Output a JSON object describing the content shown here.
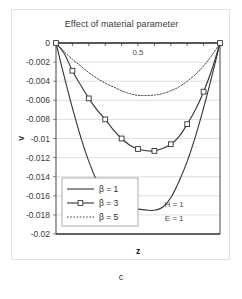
{
  "figure": {
    "caption": "c"
  },
  "chart_data": {
    "type": "line",
    "title": "Effect of material parameter",
    "xlabel": "z",
    "ylabel": "v",
    "xlim": [
      0,
      1
    ],
    "ylim": [
      -0.02,
      0
    ],
    "grid": true,
    "gridlines_y": [
      0,
      -0.002,
      -0.004,
      -0.006,
      -0.008,
      -0.01,
      -0.012,
      -0.014,
      -0.016,
      -0.018,
      -0.02
    ],
    "ytick_labels": [
      "0",
      "-0.002",
      "-0.004",
      "-0.006",
      "-0.008",
      "-0.01",
      "-0.012",
      "-0.014",
      "-0.016",
      "-0.018",
      "-0.02"
    ],
    "ytick_values": [
      0,
      -0.002,
      -0.004,
      -0.006,
      -0.008,
      -0.01,
      -0.012,
      -0.014,
      -0.016,
      -0.018,
      -0.02
    ],
    "xtick_values": [
      0,
      0.1,
      0.2,
      0.3,
      0.4,
      0.5,
      0.6,
      0.7,
      0.8,
      0.9,
      1
    ],
    "xtick_labels": [
      "",
      "",
      "",
      "",
      "",
      "0.5",
      "",
      "",
      "",
      "",
      ""
    ],
    "x_axis_position": "top",
    "legend_position": "bottom-left",
    "annotations": [
      {
        "name": "x-mid-label",
        "text": "0.5",
        "x": 0.5,
        "y": -0.0013
      },
      {
        "name": "h-parameter",
        "text": "H = 1",
        "x": 0.72,
        "y": -0.0172
      },
      {
        "name": "e-parameter",
        "text": "E = 1",
        "x": 0.72,
        "y": -0.0186
      }
    ],
    "x": [
      0,
      0.05,
      0.1,
      0.15,
      0.2,
      0.25,
      0.3,
      0.35,
      0.4,
      0.45,
      0.5,
      0.55,
      0.6,
      0.65,
      0.7,
      0.75,
      0.8,
      0.85,
      0.9,
      0.95,
      1
    ],
    "series": [
      {
        "name": "beta-1",
        "label": "β = 1",
        "style": "solid",
        "marker": "none",
        "color": "#333333",
        "values": [
          0,
          -0.0035,
          -0.0068,
          -0.0098,
          -0.0124,
          -0.0145,
          -0.0162,
          -0.0172,
          -0.01752,
          -0.01748,
          -0.0174,
          -0.01748,
          -0.01752,
          -0.0172,
          -0.0162,
          -0.0145,
          -0.0124,
          -0.0098,
          -0.0068,
          -0.0035,
          0
        ]
      },
      {
        "name": "beta-3",
        "label": "β = 3",
        "style": "solid",
        "marker": "square",
        "color": "#333333",
        "values": [
          0,
          -0.0011,
          -0.0029,
          -0.0044,
          -0.0058,
          -0.007,
          -0.008,
          -0.0091,
          -0.01,
          -0.0107,
          -0.0111,
          -0.01128,
          -0.0113,
          -0.01105,
          -0.0106,
          -0.0098,
          -0.0085,
          -0.007,
          -0.0051,
          -0.0028,
          0
        ]
      },
      {
        "name": "beta-5",
        "label": "β = 5",
        "style": "dotted",
        "marker": "none",
        "color": "#444444",
        "values": [
          0,
          -0.0009,
          -0.0017,
          -0.0024,
          -0.0031,
          -0.0037,
          -0.0042,
          -0.0046,
          -0.005,
          -0.0053,
          -0.00548,
          -0.0055,
          -0.00545,
          -0.0053,
          -0.005,
          -0.0046,
          -0.004,
          -0.0033,
          -0.0024,
          -0.0013,
          0
        ]
      }
    ],
    "markers_beta3": {
      "x": [
        0,
        0.1,
        0.2,
        0.3,
        0.4,
        0.5,
        0.6,
        0.7,
        0.8,
        0.9,
        1
      ],
      "values": [
        0,
        -0.0029,
        -0.0058,
        -0.008,
        -0.01,
        -0.0111,
        -0.0113,
        -0.0106,
        -0.0085,
        -0.0051,
        0
      ]
    }
  },
  "legend": {
    "items": [
      {
        "label": "β = 1"
      },
      {
        "label": "β = 3"
      },
      {
        "label": "β = 5"
      }
    ]
  }
}
